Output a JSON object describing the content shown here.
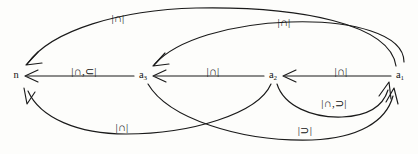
{
  "diagram": {
    "type": "directed-graph",
    "nodes": [
      {
        "id": "n",
        "label": "n",
        "subscript": "",
        "x": 16,
        "y": 75
      },
      {
        "id": "a3",
        "label": "a",
        "subscript": "3",
        "x": 143,
        "y": 75
      },
      {
        "id": "a2",
        "label": "a",
        "subscript": "2",
        "x": 273,
        "y": 75
      },
      {
        "id": "a1",
        "label": "a",
        "subscript": "1",
        "x": 400,
        "y": 75
      }
    ],
    "edges": [
      {
        "id": "e-a1-n-top",
        "from": "a1",
        "to": "n",
        "label": "|∩|",
        "label_x": 118,
        "label_y": 18,
        "shape": "arc-top-long"
      },
      {
        "id": "e-a1-a3-top",
        "from": "a1",
        "to": "a3",
        "label": "|∩|",
        "label_x": 284,
        "label_y": 22,
        "shape": "arc-top-short"
      },
      {
        "id": "e-a3-n",
        "from": "a3",
        "to": "n",
        "label": "|∩,⊂|",
        "label_x": 84,
        "label_y": 71,
        "shape": "straight"
      },
      {
        "id": "e-a2-a3",
        "from": "a2",
        "to": "a3",
        "label": "|∩|",
        "label_x": 213,
        "label_y": 71,
        "shape": "straight"
      },
      {
        "id": "e-a1-a2",
        "from": "a1",
        "to": "a2",
        "label": "|∩|",
        "label_x": 341,
        "label_y": 71,
        "shape": "straight"
      },
      {
        "id": "e-a2-n-bot",
        "from": "a2",
        "to": "n",
        "label": "|∩|",
        "label_x": 122,
        "label_y": 127,
        "shape": "arc-bottom-long"
      },
      {
        "id": "e-a3-a1-bot",
        "from": "a3",
        "to": "a1",
        "label": "|⊃|",
        "label_x": 305,
        "label_y": 130,
        "shape": "arc-bottom-cross"
      },
      {
        "id": "e-a2-a1-low",
        "from": "a2",
        "to": "a1",
        "label": "|∩,⊃|",
        "label_x": 334,
        "label_y": 103,
        "shape": "arc-lower-right"
      }
    ],
    "colors": {
      "stroke": "#1a1a1a",
      "text": "#111111",
      "background": "#fdfdfb"
    }
  }
}
